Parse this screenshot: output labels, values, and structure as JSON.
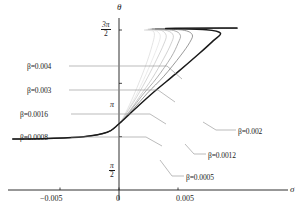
{
  "chart_data": {
    "type": "line",
    "title": "",
    "xlabel": "σ",
    "ylabel": "θ",
    "xlim": [
      -0.0092,
      0.0122
    ],
    "ylim": [
      0,
      5.3
    ],
    "grid": false,
    "legend_position": "inline-annotations",
    "x_ticks": [
      {
        "value": -0.005,
        "label": "−0.005"
      },
      {
        "value": 0,
        "label": "0"
      },
      {
        "value": 0.005,
        "label": "0.005"
      }
    ],
    "y_ticks": [
      {
        "value": 1.5708,
        "label": "π/2",
        "num": "π",
        "den": "2"
      },
      {
        "value": 3.1416,
        "label": "π",
        "num": "",
        "den": ""
      },
      {
        "value": 4.7124,
        "label": "3π/2",
        "num": "3π",
        "den": "2"
      }
    ],
    "series": [
      {
        "name": "β=0.0005",
        "beta": 0.0005,
        "color": "#d8d8d8",
        "width": 0.7,
        "fold_x": 0.003,
        "points": [
          [
            -0.009,
            1.5
          ],
          [
            -0.006,
            1.52
          ],
          [
            -0.003,
            1.57
          ],
          [
            -0.001,
            1.7
          ],
          [
            0.0,
            1.95
          ],
          [
            0.0006,
            2.3
          ],
          [
            0.0012,
            2.75
          ],
          [
            0.0018,
            3.25
          ],
          [
            0.0024,
            3.8
          ],
          [
            0.0028,
            4.25
          ],
          [
            0.003,
            4.55
          ],
          [
            0.0029,
            4.68
          ],
          [
            0.0026,
            4.72
          ],
          [
            0.01,
            4.76
          ]
        ]
      },
      {
        "name": "β=0.0008",
        "beta": 0.0008,
        "color": "#c4c4c4",
        "width": 0.7,
        "fold_x": 0.004,
        "points": [
          [
            -0.009,
            1.5
          ],
          [
            -0.006,
            1.52
          ],
          [
            -0.003,
            1.57
          ],
          [
            -0.001,
            1.7
          ],
          [
            0.0,
            1.95
          ],
          [
            0.0008,
            2.35
          ],
          [
            0.0016,
            2.8
          ],
          [
            0.0024,
            3.3
          ],
          [
            0.0032,
            3.85
          ],
          [
            0.0038,
            4.3
          ],
          [
            0.004,
            4.55
          ],
          [
            0.0036,
            4.7
          ],
          [
            0.0028,
            4.74
          ],
          [
            0.01,
            4.76
          ]
        ]
      },
      {
        "name": "β=0.0012",
        "beta": 0.0012,
        "color": "#9a9a9a",
        "width": 0.8,
        "fold_x": 0.0052,
        "points": [
          [
            -0.009,
            1.5
          ],
          [
            -0.006,
            1.52
          ],
          [
            -0.003,
            1.57
          ],
          [
            -0.001,
            1.7
          ],
          [
            0.0,
            1.95
          ],
          [
            0.001,
            2.35
          ],
          [
            0.002,
            2.8
          ],
          [
            0.0032,
            3.3
          ],
          [
            0.0044,
            3.9
          ],
          [
            0.005,
            4.32
          ],
          [
            0.0052,
            4.56
          ],
          [
            0.0046,
            4.7
          ],
          [
            0.003,
            4.75
          ],
          [
            0.01,
            4.76
          ]
        ]
      },
      {
        "name": "β=0.0016",
        "beta": 0.0016,
        "color": "#7d7d7d",
        "width": 0.8,
        "fold_x": 0.0062,
        "points": [
          [
            -0.009,
            1.5
          ],
          [
            -0.006,
            1.52
          ],
          [
            -0.003,
            1.57
          ],
          [
            -0.001,
            1.7
          ],
          [
            0.0,
            1.95
          ],
          [
            0.0012,
            2.38
          ],
          [
            0.0024,
            2.85
          ],
          [
            0.0038,
            3.35
          ],
          [
            0.0052,
            3.95
          ],
          [
            0.006,
            4.35
          ],
          [
            0.0062,
            4.58
          ],
          [
            0.0054,
            4.71
          ],
          [
            0.0032,
            4.75
          ],
          [
            0.01,
            4.76
          ]
        ]
      },
      {
        "name": "β=0.002",
        "beta": 0.002,
        "color": "#1a1a1a",
        "width": 1.5,
        "fold_x": 0.0086,
        "points": [
          [
            -0.009,
            1.5
          ],
          [
            -0.006,
            1.52
          ],
          [
            -0.003,
            1.57
          ],
          [
            -0.001,
            1.7
          ],
          [
            0.0,
            1.95
          ],
          [
            0.0014,
            2.4
          ],
          [
            0.003,
            2.9
          ],
          [
            0.0048,
            3.42
          ],
          [
            0.0068,
            4.02
          ],
          [
            0.008,
            4.4
          ],
          [
            0.0086,
            4.62
          ],
          [
            0.0074,
            4.72
          ],
          [
            0.004,
            4.76
          ],
          [
            0.01,
            4.77
          ]
        ]
      },
      {
        "name": "β=0.003",
        "beta": 0.003,
        "color": "#bdbdbd",
        "width": 0.7,
        "fold_x": 0.0046,
        "points": [
          [
            -0.009,
            1.5
          ],
          [
            -0.006,
            1.52
          ],
          [
            -0.003,
            1.57
          ],
          [
            -0.001,
            1.7
          ],
          [
            0.0,
            1.95
          ],
          [
            0.0009,
            2.33
          ],
          [
            0.0018,
            2.78
          ],
          [
            0.0028,
            3.28
          ],
          [
            0.0038,
            3.88
          ],
          [
            0.0044,
            4.3
          ],
          [
            0.0046,
            4.55
          ],
          [
            0.0041,
            4.69
          ],
          [
            0.0029,
            4.74
          ],
          [
            0.01,
            4.76
          ]
        ]
      },
      {
        "name": "β=0.004",
        "beta": 0.004,
        "color": "#e2e2e2",
        "width": 0.7,
        "fold_x": 0.0035,
        "points": [
          [
            -0.009,
            1.5
          ],
          [
            -0.006,
            1.52
          ],
          [
            -0.003,
            1.57
          ],
          [
            -0.001,
            1.7
          ],
          [
            0.0,
            1.95
          ],
          [
            0.0007,
            2.32
          ],
          [
            0.0014,
            2.76
          ],
          [
            0.0021,
            3.26
          ],
          [
            0.0028,
            3.82
          ],
          [
            0.0033,
            4.26
          ],
          [
            0.0035,
            4.54
          ],
          [
            0.0032,
            4.68
          ],
          [
            0.0027,
            4.73
          ],
          [
            0.01,
            4.76
          ]
        ]
      }
    ],
    "annotations": [
      {
        "name": "beta-004",
        "text": "β=0.004",
        "x": 0.004,
        "side": "left"
      },
      {
        "name": "beta-003",
        "text": "β=0.003",
        "x": 0.003,
        "side": "left"
      },
      {
        "name": "beta-0016",
        "text": "β=0.0016",
        "x": 0.0016,
        "side": "left"
      },
      {
        "name": "beta-0008",
        "text": "β=0.0008",
        "x": 0.0008,
        "side": "left"
      },
      {
        "name": "beta-002",
        "text": "β=0.002",
        "x": 0.002,
        "side": "right"
      },
      {
        "name": "beta-0012",
        "text": "β=0.0012",
        "x": 0.0012,
        "side": "right"
      },
      {
        "name": "beta-0005",
        "text": "β=0.0005",
        "x": 0.0005,
        "side": "right"
      }
    ]
  },
  "axes": {
    "x_axis_label": "σ",
    "y_axis_label": "θ",
    "x_tick_labels": [
      "−0.005",
      "0",
      "0.005"
    ],
    "y_tick_3pi2_num": "3π",
    "y_tick_3pi2_den": "2",
    "y_tick_pi": "π",
    "y_tick_pi2_num": "π",
    "y_tick_pi2_den": "2"
  },
  "labels": {
    "l1": "β=0.004",
    "l2": "β=0.003",
    "l3": "β=0.0016",
    "l4": "β=0.0008",
    "r1": "β=0.002",
    "r2": "β=0.0012",
    "r3": "β=0.0005"
  }
}
